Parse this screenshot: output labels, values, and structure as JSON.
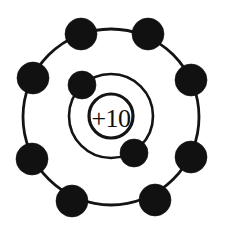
{
  "diagram": {
    "element_symbol_hint": "Ne",
    "nucleus": {
      "label": "+10",
      "charge": 10,
      "cx": 111,
      "cy": 116,
      "r": 22,
      "color": "#141414",
      "fill": "#ffffff"
    },
    "shells": [
      {
        "name": "inner-shell",
        "index": 1,
        "electron_count": 2,
        "cx": 111,
        "cy": 116,
        "r": 42,
        "stroke_width": 2.6,
        "color": "#141414",
        "electrons": [
          {
            "name": "inner-electron-1",
            "cx": 82,
            "cy": 85,
            "r": 14
          },
          {
            "name": "inner-electron-2",
            "cx": 134,
            "cy": 153,
            "r": 14
          }
        ]
      },
      {
        "name": "outer-shell",
        "index": 2,
        "electron_count": 8,
        "cx": 111,
        "cy": 117,
        "r": 88,
        "stroke_width": 2.8,
        "color": "#141414",
        "electrons": [
          {
            "name": "outer-electron-1",
            "cx": 81,
            "cy": 34,
            "r": 16
          },
          {
            "name": "outer-electron-2",
            "cx": 148,
            "cy": 34,
            "r": 16
          },
          {
            "name": "outer-electron-3",
            "cx": 33,
            "cy": 78,
            "r": 16
          },
          {
            "name": "outer-electron-4",
            "cx": 191,
            "cy": 80,
            "r": 16
          },
          {
            "name": "outer-electron-5",
            "cx": 32,
            "cy": 159,
            "r": 16
          },
          {
            "name": "outer-electron-6",
            "cx": 191,
            "cy": 157,
            "r": 16
          },
          {
            "name": "outer-electron-7",
            "cx": 72,
            "cy": 201,
            "r": 16
          },
          {
            "name": "outer-electron-8",
            "cx": 155,
            "cy": 200,
            "r": 16
          }
        ]
      }
    ],
    "background_color": "#ffffff",
    "total_electrons": 10
  }
}
